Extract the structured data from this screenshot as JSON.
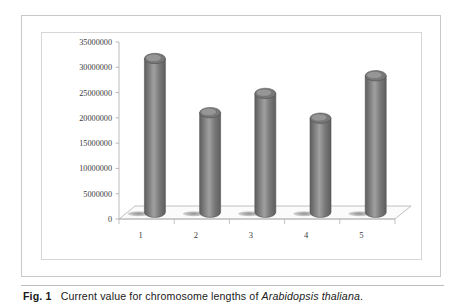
{
  "figure": {
    "caption_label": "Fig. 1",
    "caption_text": "Current value for chromosome lengths of",
    "caption_species": "Arabidopsis thaliana",
    "caption_end": "."
  },
  "chart_data": {
    "type": "bar",
    "title": "",
    "subtitle": "",
    "xlabel": "",
    "ylabel": "",
    "categories": [
      "1",
      "2",
      "3",
      "4",
      "5"
    ],
    "values": [
      30400000,
      19700000,
      23500000,
      18600000,
      27000000
    ],
    "series": [
      {
        "name": "Chromosome length (bp)",
        "values": [
          30400000,
          19700000,
          23500000,
          18600000,
          27000000
        ]
      }
    ],
    "ylim": [
      0,
      35000000
    ],
    "ytick_values": [
      0,
      5000000,
      10000000,
      15000000,
      20000000,
      25000000,
      30000000,
      35000000
    ],
    "ytick_labels": [
      "0",
      "5000000",
      "10000000",
      "15000000",
      "20000000",
      "25000000",
      "30000000",
      "35000000"
    ],
    "xtick_labels": [
      "1",
      "2",
      "3",
      "4",
      "5"
    ],
    "grid": false,
    "legend": "none",
    "style": "3d-cylinder",
    "bar_color": "#787878",
    "bar_color_light": "#a0a0a0",
    "bar_color_dark": "#5e5e5e",
    "axis_color": "#b3b3b3",
    "floor_color": "#fbfbfb"
  }
}
